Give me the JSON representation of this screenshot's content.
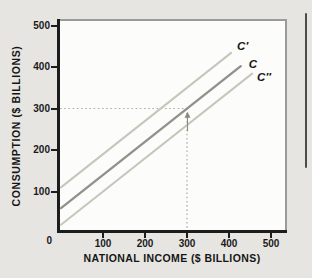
{
  "figure": {
    "x_axis_title": "NATIONAL INCOME ($ BILLIONS)",
    "y_axis_title": "CONSUMPTION ($ BILLIONS)",
    "origin_label": "0"
  },
  "chart_data": {
    "type": "line",
    "title": "",
    "xlabel": "NATIONAL INCOME ($ BILLIONS)",
    "ylabel": "CONSUMPTION ($ BILLIONS)",
    "xlim": [
      0,
      540
    ],
    "ylim": [
      0,
      515
    ],
    "x_ticks": [
      0,
      100,
      200,
      300,
      400,
      500
    ],
    "y_ticks": [
      0,
      100,
      200,
      300,
      400,
      500
    ],
    "x_tick_labels": [
      "100",
      "200",
      "300",
      "400",
      "500"
    ],
    "y_tick_labels": [
      "100",
      "200",
      "300",
      "400",
      "500"
    ],
    "grid": false,
    "legend": "labels-at-line-ends",
    "series": [
      {
        "name": "C′",
        "slope": 0.8,
        "intercept": 110,
        "points": [
          [
            0,
            110
          ],
          [
            405,
            434
          ]
        ],
        "color": "#c7c6bb",
        "width": 2
      },
      {
        "name": "C",
        "slope": 0.8,
        "intercept": 60,
        "points": [
          [
            0,
            60
          ],
          [
            428,
            402
          ]
        ],
        "color": "#92918a",
        "width": 2.4
      },
      {
        "name": "C″",
        "slope": 0.8,
        "intercept": 20,
        "points": [
          [
            0,
            20
          ],
          [
            455,
            384
          ]
        ],
        "color": "#c7c6bb",
        "width": 2
      }
    ],
    "annotations": {
      "dashed_guide": {
        "income": 300,
        "consumption": 300
      },
      "arrow_up": {
        "income": 300,
        "from_consumption": 245,
        "to_consumption": 290
      }
    }
  },
  "colors": {
    "background": "#e7e5e1",
    "plot_background": "#fcfcfa",
    "frame": "#9b9a96",
    "axis": "#1c1c1c",
    "text": "#1a1a1a",
    "light_line": "#c7c6bb",
    "main_line": "#92918a",
    "dashed_line": "#aeaea6",
    "arrow": "#8a8a84",
    "page_edge_line": "#4c4c49"
  }
}
